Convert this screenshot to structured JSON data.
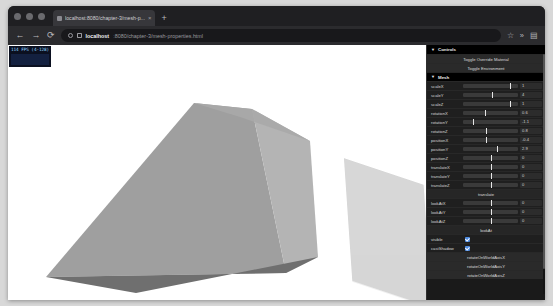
{
  "browser": {
    "tab": {
      "title": "localhost:8080/chapter-3/mesh-p...",
      "close_glyph": "×",
      "favicon": "page-favicon"
    },
    "new_tab_glyph": "+",
    "nav": {
      "back": "←",
      "forward": "→",
      "reload": "⟳"
    },
    "url": {
      "host": "localhost",
      "path": ":8080/chapter-3/mesh-properties.html"
    },
    "actions": {
      "bookmark": "☆",
      "overflow": "»",
      "menu": "▤"
    }
  },
  "stats": {
    "fps_label": "114 FPS (4-128)"
  },
  "gui": {
    "root_title": "Controls",
    "caret": "▼",
    "buttons": {
      "toggle_override_material": "Toggle Override Material",
      "toggle_environment": "Toggle Environment",
      "translate": "translate",
      "look_at": "lookAt",
      "rotate_world_x": "rotateOnWorldAxisX",
      "rotate_world_y": "rotateOnWorldAxisY",
      "rotate_world_z": "rotateOnWorldAxisZ"
    },
    "mesh_folder": "Mesh",
    "controls": [
      {
        "name": "scaleX",
        "value": "1",
        "pos": 86
      },
      {
        "name": "scaleY",
        "value": "4",
        "pos": 52
      },
      {
        "name": "scaleZ",
        "value": "1",
        "pos": 86
      },
      {
        "name": "rotationX",
        "value": "0.6",
        "pos": 40
      },
      {
        "name": "rotationY",
        "value": "-1.1",
        "pos": 18
      },
      {
        "name": "rotationZ",
        "value": "0.8",
        "pos": 42
      },
      {
        "name": "positionX",
        "value": "-0.4",
        "pos": 42
      },
      {
        "name": "positionY",
        "value": "2.9",
        "pos": 62
      },
      {
        "name": "positionZ",
        "value": "0",
        "pos": 50
      },
      {
        "name": "translateX",
        "value": "0",
        "pos": 50
      },
      {
        "name": "translateY",
        "value": "0",
        "pos": 50
      },
      {
        "name": "translateZ",
        "value": "0",
        "pos": 50
      },
      {
        "name": "lookAtX",
        "value": "0",
        "pos": 50
      },
      {
        "name": "lookAtY",
        "value": "0",
        "pos": 50
      },
      {
        "name": "lookAtZ",
        "value": "0",
        "pos": 50
      }
    ],
    "toggles": [
      {
        "name": "visible",
        "checked": true
      },
      {
        "name": "castShadow",
        "checked": true
      }
    ]
  }
}
